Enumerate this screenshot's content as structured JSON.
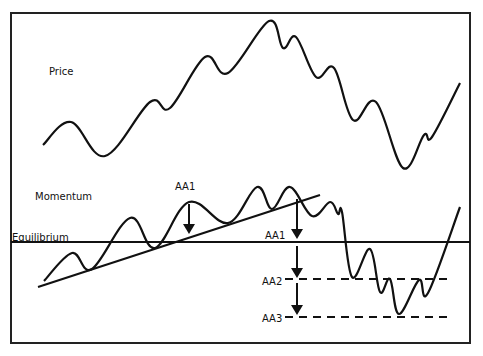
{
  "diagram": {
    "labels": {
      "price": "Price",
      "momentum": "Momentum",
      "equilibrium": "Equilibrium",
      "aa1_top": "AA1",
      "aa1": "AA1",
      "aa2": "AA2",
      "aa3": "AA3"
    },
    "colors": {
      "line": "#111111",
      "frame": "#222222",
      "background": "#ffffff"
    },
    "frame": {
      "x": 11,
      "y": 13,
      "width": 459,
      "height": 330
    },
    "price_curve": [
      [
        43,
        145
      ],
      [
        71,
        122
      ],
      [
        105,
        156
      ],
      [
        150,
        102
      ],
      [
        170,
        108
      ],
      [
        205,
        57
      ],
      [
        228,
        73
      ],
      [
        269,
        21
      ],
      [
        283,
        48
      ],
      [
        296,
        37
      ],
      [
        316,
        77
      ],
      [
        334,
        68
      ],
      [
        353,
        120
      ],
      [
        376,
        102
      ],
      [
        403,
        168
      ],
      [
        424,
        135
      ],
      [
        432,
        137
      ],
      [
        460,
        83
      ]
    ],
    "momentum_curve": [
      [
        44,
        281
      ],
      [
        72,
        253
      ],
      [
        92,
        269
      ],
      [
        130,
        218
      ],
      [
        155,
        248
      ],
      [
        189,
        202
      ],
      [
        228,
        223
      ],
      [
        257,
        187
      ],
      [
        272,
        209
      ],
      [
        290,
        187
      ],
      [
        312,
        216
      ],
      [
        330,
        202
      ],
      [
        338,
        214
      ],
      [
        342,
        212
      ],
      [
        352,
        277
      ],
      [
        370,
        249
      ],
      [
        380,
        292
      ],
      [
        390,
        279
      ],
      [
        399,
        314
      ],
      [
        419,
        280
      ],
      [
        428,
        293
      ],
      [
        460,
        207
      ]
    ],
    "trendline": {
      "x1": 38,
      "y1": 287,
      "x2": 320,
      "y2": 195
    },
    "equilibrium_y": 242,
    "levels": [
      {
        "name": "AA2",
        "y": 279,
        "x1": 285,
        "x2": 452
      },
      {
        "name": "AA3",
        "y": 317,
        "x1": 285,
        "x2": 452
      }
    ],
    "arrows": [
      {
        "x": 189,
        "y1": 204,
        "y2": 234
      },
      {
        "x": 297,
        "y1": 199,
        "y2": 239
      },
      {
        "x": 297,
        "y1": 246,
        "y2": 278
      },
      {
        "x": 297,
        "y1": 283,
        "y2": 315
      }
    ]
  }
}
